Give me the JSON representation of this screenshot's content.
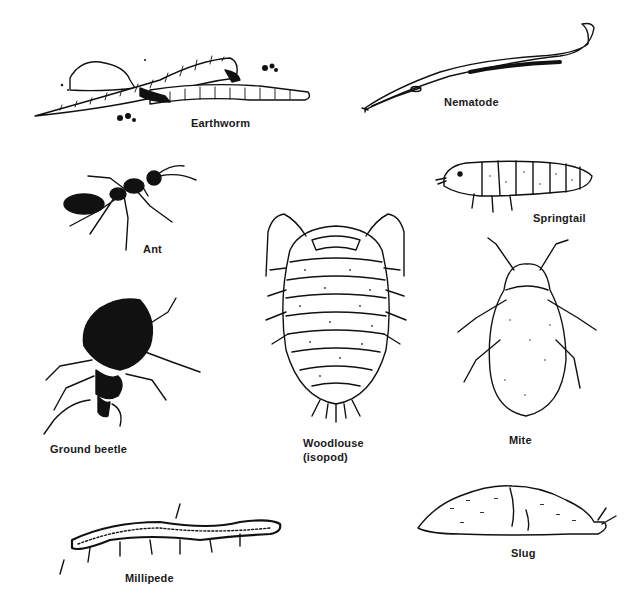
{
  "figure": {
    "type": "illustration",
    "style": "black-and-white line drawings",
    "organisms": [
      {
        "id": "earthworm",
        "label": "Earthworm"
      },
      {
        "id": "nematode",
        "label": "Nematode"
      },
      {
        "id": "ant",
        "label": "Ant"
      },
      {
        "id": "springtail",
        "label": "Springtail"
      },
      {
        "id": "woodlouse",
        "label": "Woodlouse",
        "sublabel": "(isopod)"
      },
      {
        "id": "mite",
        "label": "Mite"
      },
      {
        "id": "ground-beetle",
        "label": "Ground beetle"
      },
      {
        "id": "millipede",
        "label": "Millipede"
      },
      {
        "id": "slug",
        "label": "Slug"
      }
    ]
  },
  "colors": {
    "ink": "#111111",
    "paper": "#ffffff",
    "stipple": "#333333"
  }
}
